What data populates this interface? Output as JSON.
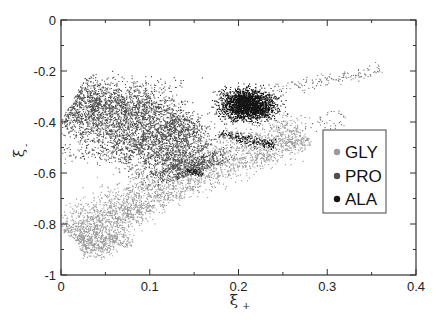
{
  "chart_data": {
    "type": "scatter",
    "title": "",
    "xlabel": "ξ+",
    "ylabel": "ξ-",
    "xlim": [
      0,
      0.4
    ],
    "ylim": [
      -1,
      0
    ],
    "x_ticks": [
      0,
      0.1,
      0.2,
      0.3,
      0.4
    ],
    "x_tick_labels": [
      "0",
      "0.1",
      "0.2",
      "0.3",
      "0.4"
    ],
    "y_ticks": [
      0,
      -0.2,
      -0.4,
      -0.6,
      -0.8,
      -1
    ],
    "y_tick_labels": [
      "0",
      "-0.2",
      "-0.4",
      "-0.6",
      "-0.8",
      "-1"
    ],
    "x_minor_step": 0.05,
    "y_minor_step": 0.1,
    "grid": false,
    "legend_position": "right-center (inside plot)",
    "series": [
      {
        "name": "GLY",
        "color": "#9a9a9a",
        "description": "curved band from (0.02,-0.87) rising to (0.28,-0.42)",
        "regions": [
          {
            "type": "band",
            "path": [
              [
                0.015,
                -0.86
              ],
              [
                0.03,
                -0.82
              ],
              [
                0.05,
                -0.77
              ],
              [
                0.08,
                -0.7
              ],
              [
                0.11,
                -0.64
              ],
              [
                0.15,
                -0.58
              ],
              [
                0.19,
                -0.53
              ],
              [
                0.23,
                -0.48
              ],
              [
                0.27,
                -0.43
              ]
            ],
            "width": 0.035,
            "n": 2600
          },
          {
            "type": "band",
            "path": [
              [
                0.02,
                -0.89
              ],
              [
                0.04,
                -0.88
              ],
              [
                0.06,
                -0.87
              ],
              [
                0.07,
                -0.84
              ]
            ],
            "width": 0.02,
            "n": 350
          },
          {
            "type": "band",
            "path": [
              [
                0.06,
                -0.79
              ],
              [
                0.08,
                -0.76
              ],
              [
                0.11,
                -0.7
              ],
              [
                0.15,
                -0.64
              ],
              [
                0.2,
                -0.57
              ],
              [
                0.25,
                -0.5
              ],
              [
                0.28,
                -0.46
              ]
            ],
            "width": 0.012,
            "n": 500
          }
        ]
      },
      {
        "name": "PRO",
        "color": "#4f4f4f",
        "description": "broad band from (0.01,-0.32) to (0.15,-0.62)",
        "regions": [
          {
            "type": "band",
            "path": [
              [
                0.01,
                -0.33
              ],
              [
                0.04,
                -0.36
              ],
              [
                0.07,
                -0.4
              ],
              [
                0.1,
                -0.44
              ],
              [
                0.12,
                -0.49
              ],
              [
                0.14,
                -0.55
              ],
              [
                0.15,
                -0.6
              ]
            ],
            "width": 0.05,
            "n": 3600
          },
          {
            "type": "band",
            "path": [
              [
                0.03,
                -0.32
              ],
              [
                0.07,
                -0.31
              ],
              [
                0.1,
                -0.33
              ],
              [
                0.13,
                -0.38
              ],
              [
                0.15,
                -0.45
              ]
            ],
            "width": 0.025,
            "n": 900
          },
          {
            "type": "scatter",
            "center": [
              0.05,
              -0.52
            ],
            "spread": [
              0.04,
              0.03
            ],
            "n": 90
          },
          {
            "type": "scatter",
            "center": [
              0.1,
              -0.25
            ],
            "spread": [
              0.04,
              0.03
            ],
            "n": 60
          }
        ]
      },
      {
        "name": "ALA",
        "color": "#141414",
        "description": "compact cluster at (0.17-0.25, -0.25 to -0.45)",
        "regions": [
          {
            "type": "blob",
            "center": [
              0.21,
              -0.33
            ],
            "spread": [
              0.025,
              0.05
            ],
            "n": 2300
          },
          {
            "type": "band",
            "path": [
              [
                0.18,
                -0.44
              ],
              [
                0.21,
                -0.47
              ],
              [
                0.24,
                -0.49
              ]
            ],
            "width": 0.008,
            "n": 220
          },
          {
            "type": "band",
            "path": [
              [
                0.14,
                -0.59
              ],
              [
                0.16,
                -0.6
              ]
            ],
            "width": 0.005,
            "n": 60
          }
        ]
      },
      {
        "name": "sparse",
        "color": "#777777",
        "legend": false,
        "description": "sparse trailing points",
        "regions": [
          {
            "type": "band",
            "path": [
              [
                0.24,
                -0.27
              ],
              [
                0.28,
                -0.25
              ],
              [
                0.32,
                -0.22
              ],
              [
                0.36,
                -0.19
              ]
            ],
            "width": 0.01,
            "n": 140
          },
          {
            "type": "band",
            "path": [
              [
                0.0,
                -0.52
              ],
              [
                0.05,
                -0.53
              ],
              [
                0.1,
                -0.52
              ],
              [
                0.14,
                -0.5
              ]
            ],
            "width": 0.015,
            "n": 80
          },
          {
            "type": "band",
            "path": [
              [
                0.22,
                -0.46
              ],
              [
                0.28,
                -0.4
              ],
              [
                0.32,
                -0.38
              ]
            ],
            "width": 0.02,
            "n": 70
          }
        ]
      }
    ]
  },
  "legend": {
    "items": [
      {
        "label": "GLY",
        "color": "#9a9a9a"
      },
      {
        "label": "PRO",
        "color": "#4f4f4f"
      },
      {
        "label": "ALA",
        "color": "#141414"
      }
    ]
  },
  "axes": {
    "x_title_main": "ξ",
    "x_title_sub": "+",
    "y_title_main": "ξ",
    "y_title_sub": "-"
  }
}
